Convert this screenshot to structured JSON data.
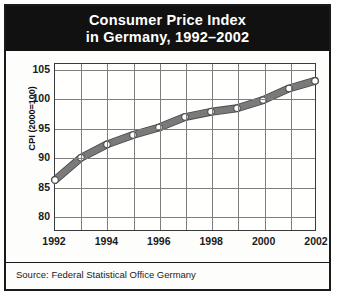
{
  "title": {
    "line1": "Consumer Price Index",
    "line2": "in Germany, 1992–2002"
  },
  "source": {
    "text": "Source: Federal Statistical Office Germany"
  },
  "axis": {
    "y_label_main": "CPI",
    "y_label_sub": " (2000=100)"
  },
  "colors": {
    "banner_bg": "#111111",
    "banner_text": "#ffffff",
    "series": "#7a7a7a",
    "series_edge": "#4a4a4a",
    "marker_fill": "#ffffff",
    "grid": "#7d7d7d",
    "frame": "#1a1a1a",
    "page_bg": "#ffffff"
  },
  "chart_data": {
    "type": "line",
    "title": "Consumer Price Index in Germany, 1992–2002",
    "xlabel": "",
    "ylabel": "CPI (2000=100)",
    "x": [
      1992,
      1993,
      1994,
      1995,
      1996,
      1997,
      1998,
      1999,
      2000,
      2001,
      2002
    ],
    "values": [
      86.1,
      89.9,
      92.2,
      93.8,
      95.1,
      96.9,
      97.8,
      98.4,
      99.8,
      101.8,
      103.1
    ],
    "series": [
      {
        "name": "CPI (2000=100)",
        "values": [
          86.1,
          89.9,
          92.2,
          93.8,
          95.1,
          96.9,
          97.8,
          98.4,
          99.8,
          101.8,
          103.1
        ]
      }
    ],
    "xlim": [
      1992,
      2002
    ],
    "ylim": [
      77.5,
      106.0
    ],
    "yticks": [
      80,
      85,
      90,
      95,
      100,
      105
    ],
    "ytick_labels": [
      "80",
      "85",
      "90",
      "95",
      "100",
      "105"
    ],
    "xticks": [
      1992,
      1994,
      1996,
      1998,
      2000,
      2002
    ],
    "xtick_labels": [
      "1992",
      "1994",
      "1996",
      "1998",
      "2000",
      "2002"
    ],
    "gridlines_x": [
      1992,
      1993,
      1994,
      1995,
      1996,
      1997,
      1998,
      1999,
      2000,
      2001,
      2002
    ],
    "grid": true,
    "legend": "none",
    "markers": "circle",
    "source": "Federal Statistical Office Germany"
  }
}
